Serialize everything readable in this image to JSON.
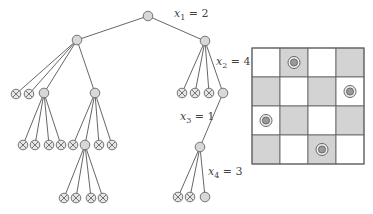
{
  "colors": {
    "line": "#555555",
    "node_fill": "#d8d8d8",
    "node_stroke": "#666666",
    "grid_shade": "#d3d3d3",
    "grid_line": "#666666",
    "queen_fill": "#999999"
  },
  "tree": {
    "nodes": [
      {
        "id": "root",
        "x": 148,
        "y": 16,
        "type": "node"
      },
      {
        "id": "L1",
        "x": 77,
        "y": 40,
        "type": "node",
        "parent": "root"
      },
      {
        "id": "R1",
        "x": 205,
        "y": 41,
        "type": "node",
        "parent": "root"
      },
      {
        "id": "L1a",
        "x": 16,
        "y": 94,
        "type": "dead",
        "parent": "L1"
      },
      {
        "id": "L1b",
        "x": 29,
        "y": 94,
        "type": "dead",
        "parent": "L1"
      },
      {
        "id": "L1c",
        "x": 44,
        "y": 93,
        "type": "node",
        "parent": "L1"
      },
      {
        "id": "L1d",
        "x": 95,
        "y": 93,
        "type": "node",
        "parent": "L1"
      },
      {
        "id": "L1c1",
        "x": 23,
        "y": 145,
        "type": "dead",
        "parent": "L1c"
      },
      {
        "id": "L1c2",
        "x": 35,
        "y": 145,
        "type": "dead",
        "parent": "L1c"
      },
      {
        "id": "L1c3",
        "x": 49,
        "y": 145,
        "type": "dead",
        "parent": "L1c"
      },
      {
        "id": "L1c4",
        "x": 61,
        "y": 145,
        "type": "dead",
        "parent": "L1c"
      },
      {
        "id": "L1d1",
        "x": 73,
        "y": 145,
        "type": "dead",
        "parent": "L1d"
      },
      {
        "id": "L1d2",
        "x": 85,
        "y": 145,
        "type": "node",
        "parent": "L1d"
      },
      {
        "id": "L1d3",
        "x": 99,
        "y": 145,
        "type": "dead",
        "parent": "L1d"
      },
      {
        "id": "L1d4",
        "x": 112,
        "y": 145,
        "type": "dead",
        "parent": "L1d"
      },
      {
        "id": "L1d2a",
        "x": 64,
        "y": 198,
        "type": "dead",
        "parent": "L1d2"
      },
      {
        "id": "L1d2b",
        "x": 76,
        "y": 198,
        "type": "dead",
        "parent": "L1d2"
      },
      {
        "id": "L1d2c",
        "x": 91,
        "y": 198,
        "type": "dead",
        "parent": "L1d2"
      },
      {
        "id": "L1d2d",
        "x": 103,
        "y": 198,
        "type": "dead",
        "parent": "L1d2"
      },
      {
        "id": "R1a",
        "x": 182,
        "y": 93,
        "type": "dead",
        "parent": "R1"
      },
      {
        "id": "R1b",
        "x": 195,
        "y": 93,
        "type": "dead",
        "parent": "R1"
      },
      {
        "id": "R1c",
        "x": 209,
        "y": 93,
        "type": "dead",
        "parent": "R1"
      },
      {
        "id": "R1d",
        "x": 223,
        "y": 93,
        "type": "node",
        "parent": "R1"
      },
      {
        "id": "R1d1",
        "x": 200,
        "y": 147,
        "type": "node",
        "parent": "R1d"
      },
      {
        "id": "R1d1a",
        "x": 178,
        "y": 197,
        "type": "dead",
        "parent": "R1d1"
      },
      {
        "id": "R1d1b",
        "x": 190,
        "y": 197,
        "type": "dead",
        "parent": "R1d1"
      },
      {
        "id": "R1d1c",
        "x": 205,
        "y": 197,
        "type": "node",
        "parent": "R1d1"
      }
    ],
    "edge_labels": [
      {
        "var": "x",
        "sub": "1",
        "rest": " = 2",
        "x": 174,
        "y": 8
      },
      {
        "var": "x",
        "sub": "2",
        "rest": " = 4",
        "x": 216,
        "y": 56
      },
      {
        "var": "x",
        "sub": "3",
        "rest": " = 1",
        "x": 180,
        "y": 111
      },
      {
        "var": "x",
        "sub": "4",
        "rest": " = 3",
        "x": 208,
        "y": 166
      }
    ]
  },
  "board": {
    "x": 252,
    "y": 48,
    "width": 112,
    "height": 116,
    "rows": 4,
    "cols": 4,
    "shaded": [
      [
        false,
        true,
        false,
        true
      ],
      [
        true,
        false,
        true,
        false
      ],
      [
        false,
        true,
        false,
        true
      ],
      [
        true,
        false,
        true,
        false
      ]
    ],
    "queens": [
      {
        "row": 0,
        "col": 1
      },
      {
        "row": 1,
        "col": 3
      },
      {
        "row": 2,
        "col": 0
      },
      {
        "row": 3,
        "col": 2
      }
    ]
  }
}
